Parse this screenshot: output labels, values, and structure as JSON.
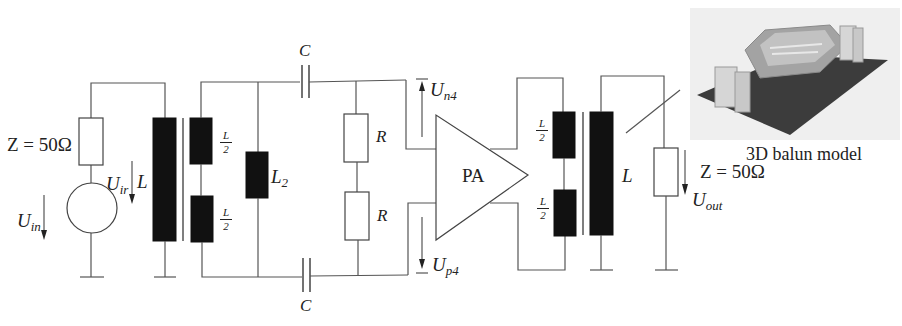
{
  "diagram": {
    "source": {
      "impedance_label": "Z = 50Ω",
      "voltage_symbol": "U",
      "voltage_sub": "in"
    },
    "input_balun": {
      "primary_label": "L",
      "primary_voltage_symbol": "U",
      "primary_voltage_sub": "ir",
      "secondary_top": {
        "num": "L",
        "den": "2"
      },
      "secondary_bottom": {
        "num": "L",
        "den": "2"
      }
    },
    "matching_network": {
      "shunt_inductor": {
        "symbol": "L",
        "sub": "2"
      },
      "capacitor_top": "C",
      "capacitor_bottom": "C",
      "resistor_top": "R",
      "resistor_bottom": "R"
    },
    "amplifier": {
      "label": "PA",
      "voltage_n": {
        "symbol": "U",
        "sub": "n4"
      },
      "voltage_p": {
        "symbol": "U",
        "sub": "p4"
      }
    },
    "output_balun": {
      "primary_top": {
        "num": "L",
        "den": "2"
      },
      "primary_bottom": {
        "num": "L",
        "den": "2"
      },
      "secondary_label": "L"
    },
    "load": {
      "impedance_label": "Z = 50Ω",
      "voltage_symbol": "U",
      "voltage_sub": "out"
    },
    "inset": {
      "caption": "3D balun model",
      "colors": {
        "board": "#3c3c3c",
        "structure": "#a8a8a8",
        "background": "#eeeeee"
      }
    }
  }
}
